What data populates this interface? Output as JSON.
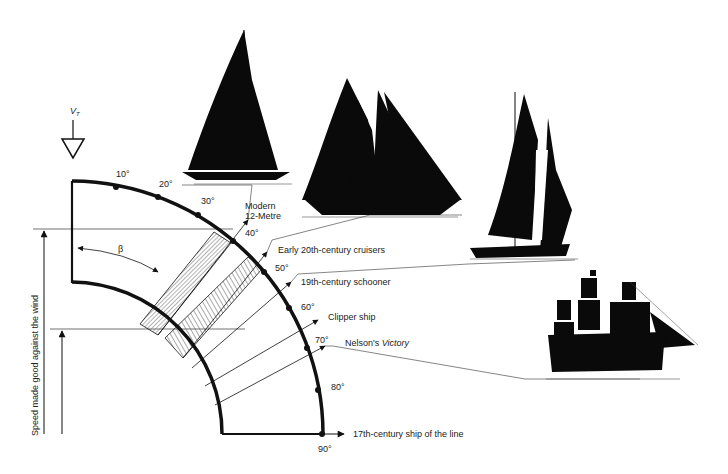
{
  "diagram": {
    "wind_label": "V",
    "wind_subscript": "T",
    "angle_symbol": "β",
    "y_axis_label": "Speed made good against the wind",
    "degree_ticks": [
      "10°",
      "20°",
      "30°",
      "40°",
      "50°",
      "60°",
      "70°",
      "80°",
      "90°"
    ],
    "vessels": [
      {
        "id": "modern-12-metre",
        "label_line1": "Modern",
        "label_line2": "12-Metre"
      },
      {
        "id": "early-20th-century-cruisers",
        "label": "Early 20th-century cruisers"
      },
      {
        "id": "19th-century-schooner",
        "label": "19th-century schooner"
      },
      {
        "id": "clipper-ship",
        "label": "Clipper ship"
      },
      {
        "id": "nelsons-victory",
        "label_prefix": "Nelson's ",
        "label_italic": "Victory"
      },
      {
        "id": "17th-century-ship-of-the-line",
        "label": "17th-century ship of the line"
      }
    ],
    "colors": {
      "ink": "#111111",
      "hatch": "#555555",
      "paper": "#ffffff"
    }
  }
}
